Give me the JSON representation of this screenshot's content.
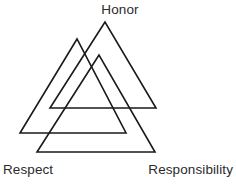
{
  "diagram": {
    "type": "interlocking-triangles",
    "name": "Valknut",
    "background_color": "#ffffff",
    "stroke_color": "#1a1a1a",
    "text_color": "#2b2b2b",
    "labels": {
      "top": "Honor",
      "bottom_left": "Respect",
      "bottom_right": "Responsibility"
    },
    "shapes": [
      {
        "id": "triangle-respect",
        "label": "Respect",
        "points": "77,39 20,133 126,133"
      },
      {
        "id": "triangle-honor",
        "label": "Honor",
        "points": "105,22 50,108 156,108"
      },
      {
        "id": "triangle-responsibility",
        "label": "Responsibility",
        "points": "99,55 37,152 155,152"
      }
    ]
  }
}
